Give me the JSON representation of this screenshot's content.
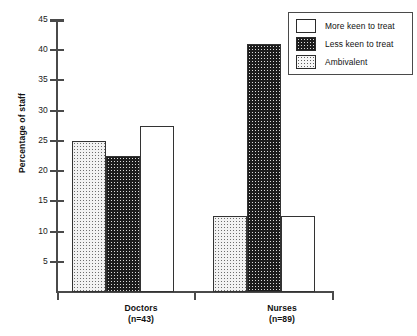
{
  "chart_data": {
    "type": "bar",
    "title": "",
    "subtitle": "",
    "xlabel": "",
    "ylabel": "Percentage of staff",
    "ylim": [
      0,
      45
    ],
    "y_ticks": [
      5,
      10,
      15,
      20,
      25,
      30,
      35,
      40,
      45
    ],
    "grid": false,
    "legend_position": "top-right",
    "categories": [
      "Doctors",
      "Nurses"
    ],
    "category_labels": [
      {
        "name": "Doctors",
        "sub": "(n=43)"
      },
      {
        "name": "Nurses",
        "sub": "(n=89)"
      }
    ],
    "series": [
      {
        "name": "Ambivalent",
        "values": [
          25.0,
          12.5
        ],
        "fill": "light-stipple"
      },
      {
        "name": "Less keen to treat",
        "values": [
          22.5,
          41.0
        ],
        "fill": "dark-stipple"
      },
      {
        "name": "More keen to treat",
        "values": [
          27.5,
          12.5
        ],
        "fill": "white"
      }
    ],
    "bar_draw_order": [
      "Ambivalent",
      "Less keen to treat",
      "More keen to treat"
    ]
  },
  "axis": {
    "y_title": "Percentage of staff",
    "y_tick_labels": [
      "45",
      "40",
      "35",
      "30",
      "25",
      "20",
      "15",
      "10",
      "5"
    ]
  },
  "legend": {
    "entries": [
      {
        "label": "More keen to treat",
        "swatch": "white"
      },
      {
        "label": "Less keen to treat",
        "swatch": "dark-stipple"
      },
      {
        "label": "Ambivalent",
        "swatch": "light-stipple"
      }
    ]
  },
  "colors": {
    "axis": "#4a4a4a",
    "bar_outline": "#333333",
    "more_keen_fill": "#ffffff",
    "less_keen_fill": "#1c1c1c",
    "ambivalent_fill": "#f2f2f2",
    "text": "#111111",
    "background": "#ffffff"
  }
}
